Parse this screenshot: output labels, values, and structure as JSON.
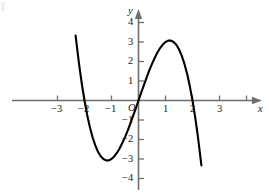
{
  "figure": {
    "title": "",
    "background_color": "#ffffff",
    "axis_color": "#6e6e6e",
    "curve_color": "#000000",
    "text_color": "#1a1a1a"
  },
  "axes": {
    "x_axis_label": "x",
    "y_axis_label": "y",
    "x_ticks": [
      {
        "value": -3,
        "label": "−3"
      },
      {
        "value": -2,
        "label": "−2"
      },
      {
        "value": -1,
        "label": "−1"
      },
      {
        "value": 1,
        "label": "1"
      },
      {
        "value": 2,
        "label": "2"
      },
      {
        "value": 3,
        "label": "3"
      }
    ],
    "y_ticks": [
      {
        "value": 4,
        "label": "4"
      },
      {
        "value": 3,
        "label": "3"
      },
      {
        "value": 2,
        "label": "2"
      },
      {
        "value": 1,
        "label": "1"
      },
      {
        "value": -1,
        "label": "−1"
      },
      {
        "value": -2,
        "label": "−2"
      },
      {
        "value": -3,
        "label": "−3"
      },
      {
        "value": -4,
        "label": "−4"
      }
    ],
    "origin_label": "O"
  },
  "chart_data": {
    "type": "line",
    "title": "",
    "xlabel": "x",
    "ylabel": "y",
    "xlim": [
      -3.45,
      3.45
    ],
    "ylim": [
      -4.6,
      4.6
    ],
    "grid": false,
    "legend": "none",
    "x_ticks": [
      -3,
      -2,
      -1,
      0,
      1,
      2,
      3
    ],
    "y_ticks": [
      -4,
      -3,
      -2,
      -1,
      0,
      1,
      2,
      3,
      4
    ],
    "series": [
      {
        "name": "y = -x^3 + 4x",
        "expression": "-x^3 + 4x",
        "x_domain": [
          -2.33,
          2.33
        ],
        "roots": [
          -2,
          0,
          2
        ],
        "local_minimum": {
          "x": -1.155,
          "y": -3.08
        },
        "local_maximum": {
          "x": 1.155,
          "y": 3.08
        },
        "x": [
          -2.33,
          -2.2,
          -2.1,
          -2.0,
          -1.9,
          -1.8,
          -1.7,
          -1.6,
          -1.5,
          -1.4,
          -1.3,
          -1.2,
          -1.155,
          -1.1,
          -1.0,
          -0.9,
          -0.8,
          -0.7,
          -0.6,
          -0.5,
          -0.4,
          -0.3,
          -0.2,
          -0.1,
          0.0,
          0.1,
          0.2,
          0.3,
          0.4,
          0.5,
          0.6,
          0.7,
          0.8,
          0.9,
          1.0,
          1.1,
          1.155,
          1.2,
          1.3,
          1.4,
          1.5,
          1.6,
          1.7,
          1.8,
          1.9,
          2.0,
          2.1,
          2.2,
          2.33
        ],
        "y": [
          3.33,
          1.85,
          0.86,
          0.0,
          -0.74,
          -1.37,
          -1.89,
          -2.3,
          -2.63,
          -2.86,
          -3.0,
          -3.07,
          -3.08,
          -3.07,
          -3.0,
          -2.87,
          -2.69,
          -2.46,
          -2.18,
          -1.88,
          -1.54,
          -1.17,
          -0.79,
          -0.4,
          0.0,
          0.4,
          0.79,
          1.17,
          1.54,
          1.88,
          2.18,
          2.46,
          2.69,
          2.87,
          3.0,
          3.07,
          3.08,
          3.07,
          3.0,
          2.86,
          2.63,
          2.3,
          1.89,
          1.37,
          0.74,
          0.0,
          -0.86,
          -1.85,
          -3.33
        ]
      }
    ]
  }
}
